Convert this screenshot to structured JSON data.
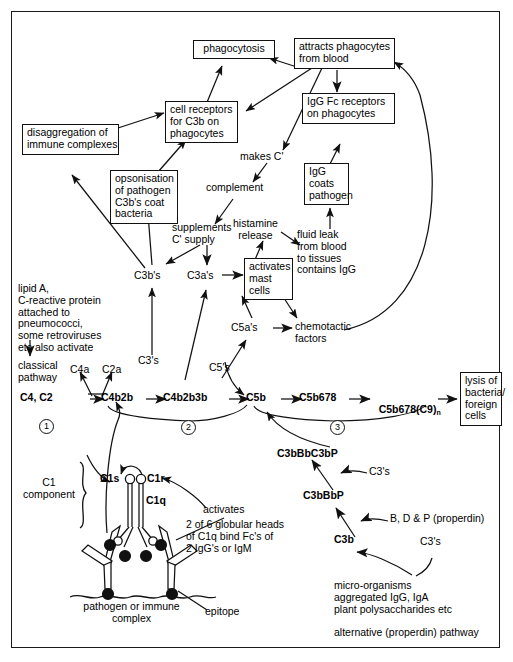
{
  "diagram": {
    "stroke_color": "#111111",
    "background": "#ffffff"
  },
  "boxes": {
    "phagocytosis": "phagocytosis",
    "attracts_phagocytes": "attracts phagocytes\nfrom blood",
    "igg_fc_receptors": "IgG Fc receptors\non phagocytes",
    "cell_receptors_c3b": "cell receptors\nfor C3b on\nphagocytes",
    "disaggregation": "disaggregation of\nimmune complexes",
    "opsonisation": "opsonisation\nof pathogen\nC3b's coat\nbacteria",
    "igg_coats_pathogen": "IgG\ncoats\npathogen",
    "activates_mast_cells": "activates\nmast\ncells",
    "lysis": "lysis of\nbacteria/\nforeign\ncells"
  },
  "labels": {
    "makes_c": "makes C'",
    "complement": "complement",
    "supplements_c_supply": "supplements\nC' supply",
    "histamine_release": "histamine\nrelease",
    "fluid_leak": "fluid leak\nfrom blood\nto tissues\ncontains IgG",
    "c3bs": "C3b's",
    "c3as": "C3a's",
    "c5as": "C5a's",
    "c5s": "C5's",
    "c3s_left": "C3's",
    "chemotactic_factors": "chemotactic\nfactors",
    "lipid_a_block": "lipid A,\nC-reactive protein\nattached to\npneumococci,\nsome retroviruses\netc also activate",
    "classical_pathway": "classical\npathway",
    "c4a": "C4a",
    "c2a": "C2a",
    "c1_component": "C1\ncomponent",
    "c1s": "C1s",
    "c1r": "C1r",
    "c1q": "C1q",
    "activates": "activates",
    "globular_heads": "2 of 6 globular heads\nof C1q bind Fc's of\n2 IgG's or IgM",
    "pathogen_or_immune": "pathogen or immune\ncomplex",
    "epitope": "epitope",
    "c3bbbc3bp": "C3bBbC3bP",
    "c3bbbp": "C3bBbP",
    "c3b": "C3b",
    "c3s_mid": "C3's",
    "c3s_right": "C3's",
    "bdp_properdin": "B, D & P (properdin)",
    "microorganisms_block": "micro-organisms\naggregated IgG, IgA\nplant polysaccharides etc",
    "alternative_pathway": "alternative (properdin) pathway"
  },
  "pathway_chain": {
    "steps": [
      "C4, C2",
      "C4b2b",
      "C4b2b3b",
      "C5b",
      "C5b678",
      "C5b678(C9)"
    ],
    "last_subscript": "n",
    "stage_numbers": [
      "1",
      "2",
      "3"
    ]
  }
}
